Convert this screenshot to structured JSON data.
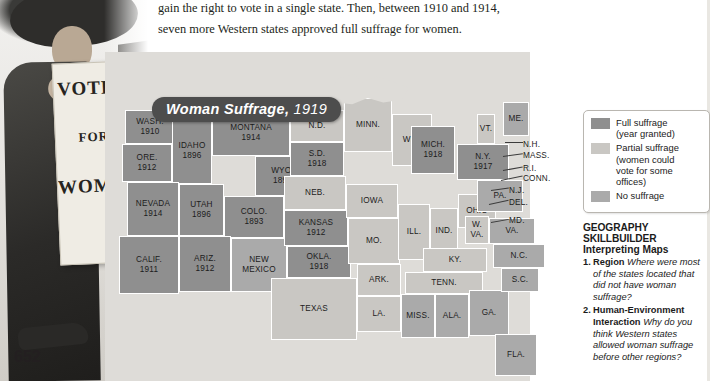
{
  "page": {
    "number": "652",
    "body_lines": [
      "gain the right to vote in a single state. Then, between 1910 and 1914,",
      "seven more Western states approved full suffrage for women."
    ]
  },
  "photo": {
    "sign_line1": "VOTES",
    "sign_line2": "FOR",
    "sign_line3": "WOMEN"
  },
  "map": {
    "title_main": "Woman Suffrage,",
    "title_year": "1919",
    "states": [
      {
        "name": "WASH.",
        "year": "1910",
        "status": "full"
      },
      {
        "name": "ORE.",
        "year": "1912",
        "status": "full"
      },
      {
        "name": "IDAHO",
        "year": "1896",
        "status": "full"
      },
      {
        "name": "MONTANA",
        "year": "1914",
        "status": "full"
      },
      {
        "name": "WYO.",
        "year": "1890",
        "status": "full"
      },
      {
        "name": "NEVADA",
        "year": "1914",
        "status": "full"
      },
      {
        "name": "UTAH",
        "year": "1896",
        "status": "full"
      },
      {
        "name": "COLO.",
        "year": "1893",
        "status": "full"
      },
      {
        "name": "CALIF.",
        "year": "1911",
        "status": "full"
      },
      {
        "name": "ARIZ.",
        "year": "1912",
        "status": "full"
      },
      {
        "name": "NEW MEXICO",
        "year": "",
        "status": "none"
      },
      {
        "name": "N.D.",
        "year": "",
        "status": "partial"
      },
      {
        "name": "S.D.",
        "year": "1918",
        "status": "full"
      },
      {
        "name": "NEB.",
        "year": "",
        "status": "partial"
      },
      {
        "name": "KANSAS",
        "year": "1912",
        "status": "full"
      },
      {
        "name": "OKLA.",
        "year": "1918",
        "status": "full"
      },
      {
        "name": "TEXAS",
        "year": "",
        "status": "partial"
      },
      {
        "name": "MINN.",
        "year": "",
        "status": "partial"
      },
      {
        "name": "IOWA",
        "year": "",
        "status": "partial"
      },
      {
        "name": "MO.",
        "year": "",
        "status": "partial"
      },
      {
        "name": "ARK.",
        "year": "",
        "status": "partial"
      },
      {
        "name": "LA.",
        "year": "",
        "status": "partial"
      },
      {
        "name": "WIS.",
        "year": "",
        "status": "partial"
      },
      {
        "name": "ILL.",
        "year": "",
        "status": "partial"
      },
      {
        "name": "MICH.",
        "year": "1918",
        "status": "full"
      },
      {
        "name": "IND.",
        "year": "",
        "status": "partial"
      },
      {
        "name": "OHIO",
        "year": "",
        "status": "partial"
      },
      {
        "name": "KY.",
        "year": "",
        "status": "partial"
      },
      {
        "name": "TENN.",
        "year": "",
        "status": "partial"
      },
      {
        "name": "MISS.",
        "year": "",
        "status": "none"
      },
      {
        "name": "ALA.",
        "year": "",
        "status": "none"
      },
      {
        "name": "GA.",
        "year": "",
        "status": "none"
      },
      {
        "name": "FLA.",
        "year": "",
        "status": "none"
      },
      {
        "name": "S.C.",
        "year": "",
        "status": "none"
      },
      {
        "name": "N.C.",
        "year": "",
        "status": "none"
      },
      {
        "name": "VA.",
        "year": "",
        "status": "none"
      },
      {
        "name": "W. VA.",
        "year": "",
        "status": "partial"
      },
      {
        "name": "PA.",
        "year": "",
        "status": "none"
      },
      {
        "name": "N.Y.",
        "year": "1917",
        "status": "full"
      },
      {
        "name": "VT.",
        "year": "",
        "status": "partial"
      },
      {
        "name": "ME.",
        "year": "",
        "status": "none"
      }
    ],
    "callout_labels": [
      "N.H.",
      "MASS.",
      "R.I.",
      "CONN.",
      "N.J.",
      "DEL.",
      "MD."
    ]
  },
  "legend": {
    "items": [
      {
        "swatch": "full",
        "line1": "Full suffrage",
        "line2": "(year granted)",
        "line3": "",
        "line4": ""
      },
      {
        "swatch": "partial",
        "line1": "Partial suffrage",
        "line2": "(women could",
        "line3": "vote for some",
        "line4": "offices)"
      },
      {
        "swatch": "none",
        "line1": "No suffrage",
        "line2": "",
        "line3": "",
        "line4": ""
      }
    ]
  },
  "skillbuilder": {
    "header": "GEOGRAPHY SKILLBUILDER",
    "subheader": "Interpreting Maps",
    "questions": [
      {
        "num": "1.",
        "term": "Region",
        "text": "Where were most of the states located that did not have woman suffrage?"
      },
      {
        "num": "2.",
        "term": "Human-Environment Interaction",
        "text": "Why do you think Western states allowed woman suffrage before other regions?"
      }
    ]
  }
}
